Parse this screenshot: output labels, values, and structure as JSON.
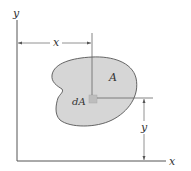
{
  "diagram": {
    "axes": {
      "x_label": "x",
      "y_label": "y"
    },
    "region": {
      "label": "A",
      "fill": "#d6d6d6",
      "stroke": "#555555"
    },
    "element": {
      "label": "dA",
      "fill": "#bdbdbd"
    },
    "dimensions": {
      "horizontal_label": "x",
      "vertical_label": "y"
    },
    "colors": {
      "line": "#555555",
      "dim_line": "#777777",
      "text": "#333333"
    }
  }
}
